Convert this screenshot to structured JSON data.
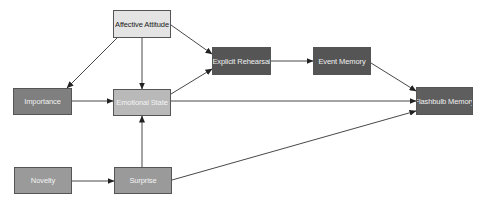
{
  "diagram": {
    "nodes": {
      "affective_attitude": {
        "label": "Affective Attitude",
        "fill": "#e4e4e4",
        "text_color": "#222222"
      },
      "explicit_rehearsal": {
        "label": "Explicit Rehearsal",
        "fill": "#555555",
        "text_color": "#f0f0f0"
      },
      "event_memory": {
        "label": "Event Memory",
        "fill": "#555555",
        "text_color": "#f0f0f0"
      },
      "flashbulb_memory": {
        "label": "Flashbulb Memory",
        "fill": "#5e5e5e",
        "text_color": "#f0f0f0"
      },
      "importance": {
        "label": "Importance",
        "fill": "#7f7f7f",
        "text_color": "#f0f0f0"
      },
      "emotional_state": {
        "label": "Emotional State",
        "fill": "#b9b9b9",
        "text_color": "#f4f4f4"
      },
      "novelty": {
        "label": "Novelty",
        "fill": "#9a9a9a",
        "text_color": "#f4f4f4"
      },
      "surprise": {
        "label": "Surprise",
        "fill": "#9a9a9a",
        "text_color": "#f4f4f4"
      }
    },
    "edges": [
      {
        "from": "Affective Attitude",
        "to": "Importance"
      },
      {
        "from": "Affective Attitude",
        "to": "Emotional State"
      },
      {
        "from": "Affective Attitude",
        "to": "Explicit Rehearsal"
      },
      {
        "from": "Importance",
        "to": "Emotional State"
      },
      {
        "from": "Emotional State",
        "to": "Explicit Rehearsal"
      },
      {
        "from": "Emotional State",
        "to": "Flashbulb Memory"
      },
      {
        "from": "Explicit Rehearsal",
        "to": "Event Memory"
      },
      {
        "from": "Event Memory",
        "to": "Flashbulb Memory"
      },
      {
        "from": "Novelty",
        "to": "Surprise"
      },
      {
        "from": "Surprise",
        "to": "Emotional State"
      },
      {
        "from": "Surprise",
        "to": "Flashbulb Memory"
      }
    ],
    "edge_color": "#333333"
  }
}
